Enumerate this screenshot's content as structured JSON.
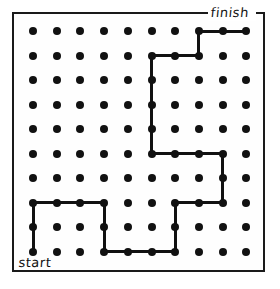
{
  "puzzle": {
    "title": "dot-grid-path-puzzle",
    "grid": {
      "rows": 10,
      "cols": 10,
      "dot_color": "#111111",
      "dot_radius": 4,
      "cell_spacing_x": 23.7,
      "cell_spacing_y": 24.5,
      "origin_x": 33,
      "origin_y": 31
    },
    "frame": {
      "x": 12,
      "y": 12,
      "width": 253,
      "height": 260,
      "border_color": "#1a1a1a",
      "border_width": 2
    },
    "labels": {
      "start": "start",
      "finish": "finish"
    },
    "path": {
      "stroke_color": "#111111",
      "stroke_width": 3,
      "description": "connected route from start dot to finish dot",
      "waypoints": [
        {
          "row": 10,
          "col": 1
        },
        {
          "row": 8,
          "col": 1
        },
        {
          "row": 8,
          "col": 4
        },
        {
          "row": 10,
          "col": 4
        },
        {
          "row": 10,
          "col": 7
        },
        {
          "row": 8,
          "col": 7
        },
        {
          "row": 8,
          "col": 9
        },
        {
          "row": 6,
          "col": 9
        },
        {
          "row": 6,
          "col": 6
        },
        {
          "row": 2,
          "col": 6
        },
        {
          "row": 2,
          "col": 8
        },
        {
          "row": 1,
          "col": 8
        },
        {
          "row": 1,
          "col": 10
        }
      ],
      "segments": [
        {
          "orientation": "vertical",
          "col": 1,
          "row_from": 8,
          "row_to": 10
        },
        {
          "orientation": "horizontal",
          "row": 8,
          "col_from": 1,
          "col_to": 4
        },
        {
          "orientation": "vertical",
          "col": 4,
          "row_from": 8,
          "row_to": 10
        },
        {
          "orientation": "horizontal",
          "row": 10,
          "col_from": 4,
          "col_to": 7
        },
        {
          "orientation": "vertical",
          "col": 7,
          "row_from": 8,
          "row_to": 10
        },
        {
          "orientation": "horizontal",
          "row": 8,
          "col_from": 7,
          "col_to": 9
        },
        {
          "orientation": "vertical",
          "col": 9,
          "row_from": 6,
          "row_to": 8
        },
        {
          "orientation": "horizontal",
          "row": 6,
          "col_from": 6,
          "col_to": 9
        },
        {
          "orientation": "vertical",
          "col": 6,
          "row_from": 2,
          "row_to": 6
        },
        {
          "orientation": "horizontal",
          "row": 2,
          "col_from": 6,
          "col_to": 8
        },
        {
          "orientation": "vertical",
          "col": 8,
          "row_from": 1,
          "row_to": 2
        },
        {
          "orientation": "horizontal",
          "row": 1,
          "col_from": 8,
          "col_to": 10
        }
      ]
    }
  }
}
